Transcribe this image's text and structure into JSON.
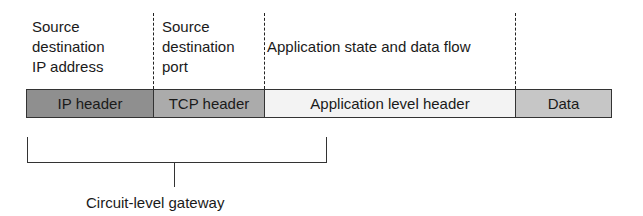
{
  "top_labels": [
    {
      "text": "Source\ndestination\nIP address"
    },
    {
      "text": "Source\ndestination\nport"
    },
    {
      "text": "Application state and data flow"
    }
  ],
  "segments": [
    {
      "label": "IP header",
      "fill": "#8f8f8f"
    },
    {
      "label": "TCP header",
      "fill": "#ababab"
    },
    {
      "label": "Application level header",
      "fill": "#f3f3f3"
    },
    {
      "label": "Data",
      "fill": "#c6c6c6"
    }
  ],
  "bracket": {
    "caption": "Circuit-level gateway",
    "spans": [
      "IP header",
      "TCP header"
    ]
  }
}
